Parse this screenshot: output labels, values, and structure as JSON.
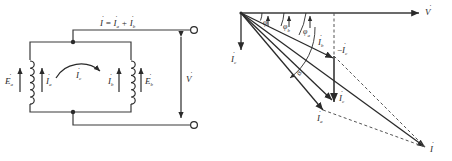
{
  "figure": {
    "title_left": "circuit-schematic-two-parallel-coils",
    "title_right": "phasor-diagram-currents"
  },
  "circuit": {
    "top_equation": {
      "main": "I",
      "dot": "̇",
      "equals": "=",
      "term_a": "I",
      "sub_a": "a",
      "plus": "+",
      "term_b": "I",
      "sub_b": "b"
    },
    "coil_a": {
      "emf_symbol": "E",
      "emf_sub": "a",
      "current_symbol": "I",
      "current_sub": "a"
    },
    "coil_b": {
      "current_symbol": "I",
      "current_sub": "b",
      "emf_symbol": "E",
      "emf_sub": "b"
    },
    "circulating": {
      "symbol": "I",
      "sub": "c"
    },
    "terminal_voltage": {
      "symbol": "V"
    }
  },
  "phasor": {
    "axis_label": {
      "symbol": "V"
    },
    "vectors": [
      {
        "name": "I-c-vertical",
        "symbol": "I",
        "sub": "c"
      },
      {
        "name": "I-b",
        "symbol": "I",
        "sub": "b"
      },
      {
        "name": "I-c-negative",
        "prefix": "−",
        "symbol": "I",
        "sub": "c"
      },
      {
        "name": "I-c-down",
        "symbol": "I",
        "sub": "c"
      },
      {
        "name": "I-a",
        "symbol": "I",
        "sub": "a"
      },
      {
        "name": "I-total",
        "symbol": "I",
        "sub": ""
      }
    ],
    "angles": [
      {
        "name": "phi",
        "symbol": "φ",
        "sub": ""
      },
      {
        "name": "phi-b",
        "symbol": "φ",
        "sub": "b"
      },
      {
        "name": "phi-a",
        "symbol": "φ",
        "sub": "a"
      }
    ],
    "arc_label": {
      "symbol": "α"
    }
  },
  "colors": {
    "ink": "#2a2a2a",
    "line": "#3a3a3a",
    "background": "#ffffff"
  }
}
